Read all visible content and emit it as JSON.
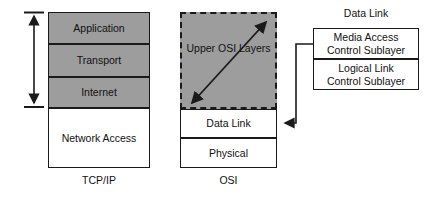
{
  "diagram": {
    "title_visible": false,
    "colors": {
      "fill_gray": "#9d9d9d",
      "fill_white": "#ffffff",
      "stroke": "#1a1a1a",
      "text": "#111111"
    },
    "tcpip": {
      "column_label": "TCP/IP",
      "layers": [
        {
          "label": "Application",
          "fill": "gray"
        },
        {
          "label": "Transport",
          "fill": "gray"
        },
        {
          "label": "Internet",
          "fill": "gray"
        },
        {
          "label": "Network Access",
          "fill": "white"
        }
      ],
      "span_arrow": {
        "name": "upper-layers-span-arrow",
        "double_headed": true,
        "orientation": "vertical"
      }
    },
    "osi": {
      "column_label": "OSI",
      "upper_box": {
        "label_line1": "Upper",
        "label_line2": "OSI",
        "label_line3": "Layers",
        "border_style": "dashed",
        "fill": "gray"
      },
      "upper_box_arrow": {
        "name": "upper-osi-layers-double-arrow",
        "double_headed": true,
        "orientation": "diagonal"
      },
      "layers": [
        {
          "label": "Data Link",
          "fill": "white"
        },
        {
          "label": "Physical",
          "fill": "white"
        }
      ]
    },
    "datalink_detail": {
      "title": "Data Link",
      "sublayers": [
        {
          "line1": "Media Access",
          "line2": "Control Sublayer"
        },
        {
          "line1": "Logical Link",
          "line2": "Control Sublayer"
        }
      ],
      "connector": {
        "name": "datalink-expansion-connector",
        "arrowhead": "left",
        "target": "osi-data-link-layer"
      }
    }
  }
}
